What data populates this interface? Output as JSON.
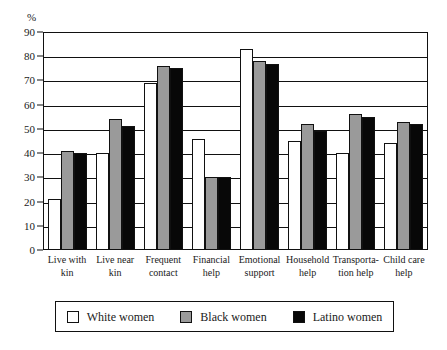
{
  "chart_data": {
    "type": "bar",
    "title": "",
    "xlabel": "",
    "ylabel": "%",
    "ylim": [
      0,
      90
    ],
    "yticks": [
      0,
      10,
      20,
      30,
      40,
      50,
      60,
      70,
      80,
      90
    ],
    "grid": true,
    "legend_position": "bottom",
    "categories": [
      "Live with\nkin",
      "Live near\nkin",
      "Frequent\ncontact",
      "Financial\nhelp",
      "Emotional\nsupport",
      "Household\nhelp",
      "Transporta-\ntion help",
      "Child care\nhelp"
    ],
    "series": [
      {
        "name": "White women",
        "color": "#ffffff",
        "values": [
          21,
          40,
          69,
          46,
          83,
          45,
          40,
          44
        ]
      },
      {
        "name": "Black women",
        "color": "#9a9a9a",
        "values": [
          41,
          54,
          76,
          30,
          78,
          52,
          56,
          53
        ]
      },
      {
        "name": "Latino women",
        "color": "#080808",
        "values": [
          40,
          51,
          75,
          30,
          77,
          49,
          55,
          52
        ]
      }
    ]
  },
  "legend": {
    "items": [
      {
        "label": "White women",
        "swatch": "white"
      },
      {
        "label": "Black women",
        "swatch": "gray"
      },
      {
        "label": "Latino women",
        "swatch": "black"
      }
    ]
  }
}
